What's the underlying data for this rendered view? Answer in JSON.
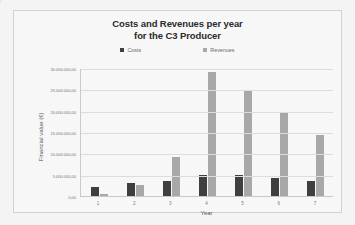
{
  "chart_data": {
    "type": "bar",
    "title": "Costs and Revenues per year for the C3 Producer",
    "title_line1": "Costs and Revenues per year",
    "title_line2": "for the C3 Producer",
    "xlabel": "Year",
    "ylabel": "Financial value (€)",
    "categories": [
      "1",
      "2",
      "3",
      "4",
      "5",
      "6",
      "7"
    ],
    "series": [
      {
        "name": "Costs",
        "color": "#3f3f3f",
        "values": [
          2000000,
          3000000,
          3600000,
          5000000,
          5000000,
          4300000,
          3500000
        ]
      },
      {
        "name": "Revenues",
        "color": "#a8a8a8",
        "values": [
          500000,
          2600000,
          9200000,
          29000000,
          24500000,
          19800000,
          14200000
        ]
      }
    ],
    "ylim": [
      0,
      30000000
    ],
    "ytick_values": [
      0,
      5000000,
      10000000,
      15000000,
      20000000,
      25000000,
      30000000
    ],
    "ytick_labels": [
      "0,00",
      "5.000.000,00",
      "10.000.000,00",
      "15.000.000,00",
      "20.000.000,00",
      "25.000.000,00",
      "30.000.000,00"
    ],
    "grid": true,
    "legend_position": "top"
  }
}
